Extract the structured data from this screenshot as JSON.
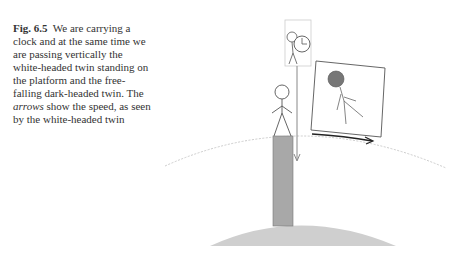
{
  "caption": {
    "label": "Fig. 6.5",
    "text_part1": "We are carrying a clock and at the same time we are passing vertically the white-headed twin standing on the platform and the free-falling dark-headed twin. The",
    "emphasis": "arrows",
    "text_part2": "show the speed, as seen by the white-headed twin"
  },
  "figure": {
    "colors": {
      "line": "#555555",
      "pillar": "#a8a8a8",
      "ground": "#cfcfcf",
      "dark_head": "#777777",
      "orbit": "#cccccc",
      "arrow_dark": "#222222",
      "arrow_light": "#888888"
    },
    "elements": [
      "observer-with-clock-box",
      "white-headed-twin-on-platform",
      "dark-headed-twin-free-falling-box",
      "vertical-speed-arrow",
      "horizontal-speed-arrow",
      "orbit-arc",
      "planet-surface"
    ]
  }
}
